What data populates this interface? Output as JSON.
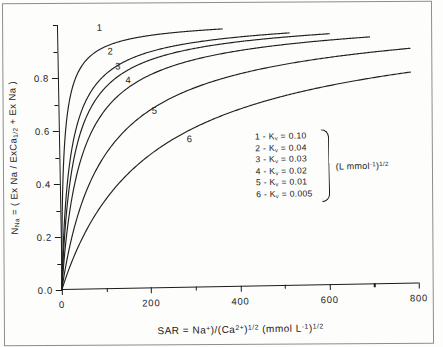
{
  "chart_data": {
    "type": "line",
    "title": "",
    "xlabel": "SAR = Na+)/(Ca2+)1/2  (mmol L-1)1/2",
    "ylabel": "NNa = ( Ex Na / ExCa1/2 + Ex Na )",
    "xlim": [
      0,
      800
    ],
    "ylim": [
      0.0,
      1.0
    ],
    "grid": false,
    "legend_position": "center-right-inside",
    "equation": "N_Na = Kv*SAR / (1 + Kv*SAR)",
    "x_ticks_major": [
      0,
      200,
      400,
      600,
      800
    ],
    "x_ticks_minor": [
      100,
      300,
      500,
      700
    ],
    "x_tick_labels": [
      "0",
      "200",
      "400",
      "600",
      "800"
    ],
    "y_ticks_major": [
      0.0,
      0.2,
      0.4,
      0.6,
      0.8
    ],
    "y_ticks_minor": [
      0.1,
      0.3,
      0.5,
      0.7,
      0.9,
      1.0
    ],
    "y_tick_labels": [
      "0.0",
      "0.2",
      "0.4",
      "0.6",
      "0.8"
    ],
    "series": [
      {
        "name": "1",
        "kv": 0.1,
        "x_end": 370,
        "values": [
          [
            0,
            0.0
          ],
          [
            10,
            0.5
          ],
          [
            20,
            0.667
          ],
          [
            30,
            0.75
          ],
          [
            40,
            0.8
          ],
          [
            60,
            0.857
          ],
          [
            80,
            0.889
          ],
          [
            100,
            0.909
          ],
          [
            140,
            0.933
          ],
          [
            180,
            0.947
          ],
          [
            240,
            0.96
          ],
          [
            300,
            0.968
          ],
          [
            370,
            0.974
          ]
        ]
      },
      {
        "name": "2",
        "kv": 0.04,
        "x_end": 520,
        "values": [
          [
            0,
            0.0
          ],
          [
            10,
            0.286
          ],
          [
            20,
            0.444
          ],
          [
            30,
            0.545
          ],
          [
            50,
            0.667
          ],
          [
            80,
            0.762
          ],
          [
            110,
            0.815
          ],
          [
            150,
            0.857
          ],
          [
            200,
            0.889
          ],
          [
            280,
            0.918
          ],
          [
            360,
            0.935
          ],
          [
            440,
            0.946
          ],
          [
            520,
            0.954
          ]
        ]
      },
      {
        "name": "3",
        "kv": 0.03,
        "x_end": 610,
        "values": [
          [
            0,
            0.0
          ],
          [
            10,
            0.231
          ],
          [
            20,
            0.375
          ],
          [
            40,
            0.545
          ],
          [
            60,
            0.643
          ],
          [
            90,
            0.73
          ],
          [
            130,
            0.796
          ],
          [
            180,
            0.844
          ],
          [
            250,
            0.882
          ],
          [
            330,
            0.908
          ],
          [
            430,
            0.928
          ],
          [
            520,
            0.94
          ],
          [
            610,
            0.948
          ]
        ]
      },
      {
        "name": "4",
        "kv": 0.02,
        "x_end": 700,
        "values": [
          [
            0,
            0.0
          ],
          [
            10,
            0.167
          ],
          [
            25,
            0.333
          ],
          [
            50,
            0.5
          ],
          [
            80,
            0.615
          ],
          [
            120,
            0.706
          ],
          [
            170,
            0.773
          ],
          [
            240,
            0.828
          ],
          [
            320,
            0.865
          ],
          [
            420,
            0.894
          ],
          [
            530,
            0.914
          ],
          [
            620,
            0.925
          ],
          [
            700,
            0.933
          ]
        ]
      },
      {
        "name": "5",
        "kv": 0.01,
        "x_end": 790,
        "values": [
          [
            0,
            0.0
          ],
          [
            20,
            0.167
          ],
          [
            50,
            0.333
          ],
          [
            80,
            0.444
          ],
          [
            120,
            0.545
          ],
          [
            170,
            0.63
          ],
          [
            230,
            0.697
          ],
          [
            300,
            0.75
          ],
          [
            380,
            0.792
          ],
          [
            470,
            0.825
          ],
          [
            570,
            0.851
          ],
          [
            680,
            0.872
          ],
          [
            790,
            0.888
          ]
        ]
      },
      {
        "name": "6",
        "kv": 0.005,
        "x_end": 790,
        "values": [
          [
            0,
            0.0
          ],
          [
            40,
            0.167
          ],
          [
            80,
            0.286
          ],
          [
            130,
            0.394
          ],
          [
            190,
            0.487
          ],
          [
            260,
            0.565
          ],
          [
            340,
            0.63
          ],
          [
            430,
            0.683
          ],
          [
            520,
            0.722
          ],
          [
            610,
            0.753
          ],
          [
            700,
            0.778
          ],
          [
            790,
            0.798
          ]
        ]
      }
    ],
    "annotations": [
      {
        "text": "1",
        "x": 95,
        "y": 0.99
      },
      {
        "text": "2",
        "x": 118,
        "y": 0.9
      },
      {
        "text": "3",
        "x": 135,
        "y": 0.843
      },
      {
        "text": "4",
        "x": 157,
        "y": 0.787
      },
      {
        "text": "5",
        "x": 215,
        "y": 0.672
      },
      {
        "text": "6",
        "x": 292,
        "y": 0.563
      }
    ]
  },
  "axes": {
    "y_title_parts": {
      "n": "N",
      "n_sub": "Na",
      "eq": " = ( Ex Na / ExCa",
      "ca_sub": "1/2",
      "tail": " + Ex Na )"
    },
    "x_title_parts": {
      "lead": "SAR = Na",
      "na_sup": "+",
      "mid": ")/(Ca",
      "ca_sup": "2+",
      "close": ")",
      "half1": "1/2",
      "units_open": " (mmol L",
      "l_sup": "-1",
      "units_close": ")",
      "half2": "1/2"
    }
  },
  "legend": {
    "entries": [
      {
        "label": "1 - K",
        "sub": "v",
        "value": " = 0.10"
      },
      {
        "label": "2 - K",
        "sub": "v",
        "value": " = 0.04"
      },
      {
        "label": "3 - K",
        "sub": "v",
        "value": " = 0.03"
      },
      {
        "label": "4 - K",
        "sub": "v",
        "value": " = 0.02"
      },
      {
        "label": "5 - K",
        "sub": "v",
        "value": " = 0.01"
      },
      {
        "label": "6 - K",
        "sub": "v",
        "value": " = 0.005"
      }
    ],
    "units": {
      "open": "(L mmol",
      "sup": "-1",
      "close": ")",
      "half": "1/2"
    }
  },
  "colors": {
    "ink": "#1b1b1b",
    "paper": "#fdfdfc",
    "border": "#8d8d8d"
  }
}
